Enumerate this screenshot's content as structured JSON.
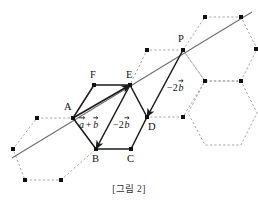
{
  "figure": {
    "caption": "[그림 2]",
    "type": "hexagonal-lattice-vector-diagram",
    "colors": {
      "solid_edge": "#1a1a1a",
      "dotted_edge": "#9a9a9a",
      "line": "#6e6e6e",
      "vertex": "#111111",
      "text": "#111111",
      "caption": "#303030",
      "background": "#ffffff"
    },
    "point_labels": [
      {
        "name": "A",
        "text": "A",
        "x": 73,
        "y": 118,
        "lx": 64,
        "ly": 110
      },
      {
        "name": "B",
        "text": "B",
        "x": 96,
        "y": 149,
        "lx": 92,
        "ly": 162
      },
      {
        "name": "C",
        "text": "C",
        "x": 131,
        "y": 149,
        "lx": 127,
        "ly": 162
      },
      {
        "name": "D",
        "text": "D",
        "x": 147,
        "y": 117,
        "lx": 148,
        "ly": 130
      },
      {
        "name": "E",
        "text": "E",
        "x": 130,
        "y": 85,
        "lx": 126,
        "ly": 78
      },
      {
        "name": "F",
        "text": "F",
        "x": 94,
        "y": 85,
        "lx": 90,
        "ly": 78
      },
      {
        "name": "P",
        "text": "P",
        "x": 183,
        "y": 50,
        "lx": 178,
        "ly": 42
      }
    ],
    "vectors": [
      {
        "name": "a-plus-b",
        "label": "a+b",
        "from": "A",
        "to": "E",
        "x1": 73,
        "y1": 118,
        "x2": 130,
        "y2": 85,
        "label_x": 79,
        "label_y": 128
      },
      {
        "name": "minus-2b-left",
        "label": "-2b",
        "from": "E",
        "to": "B",
        "x1": 130,
        "y1": 85,
        "x2": 96,
        "y2": 149,
        "label_x": 113,
        "label_y": 128
      },
      {
        "name": "minus-2b-right",
        "label": "-2b",
        "from": "P",
        "to": "D",
        "x1": 183,
        "y1": 50,
        "x2": 147,
        "y2": 117,
        "label_x": 167,
        "label_y": 91
      }
    ],
    "vector_label_parts": {
      "a": "a",
      "plus": "+",
      "b": "b",
      "minus_two": "−2"
    },
    "diagonal_line": {
      "name": "line-AP",
      "x1": 12,
      "y1": 158,
      "x2": 252,
      "y2": 12
    },
    "solid_hexagon": {
      "name": "hexagon-ABCDEF",
      "points": "73,118 94,85 130,85 147,117 131,149 96,149"
    },
    "dotted_hexagons": [
      {
        "name": "hex-lower-left",
        "points": "73,118 96,149 61,180 25,180 13,149 37,118"
      },
      {
        "name": "hex-upper-right",
        "points": "183,50 205,17 241,17 257,49 241,81 205,81"
      },
      {
        "name": "hex-left-of-P",
        "points": "183,50 147,50 130,85 147,117 183,117 205,81"
      },
      {
        "name": "hex-right-lower",
        "points": "205,81 241,81 257,113 241,145 205,145 188,113"
      }
    ],
    "lattice_dots": [
      {
        "x": 73,
        "y": 118
      },
      {
        "x": 94,
        "y": 85
      },
      {
        "x": 130,
        "y": 85
      },
      {
        "x": 147,
        "y": 117
      },
      {
        "x": 131,
        "y": 149
      },
      {
        "x": 96,
        "y": 149
      },
      {
        "x": 183,
        "y": 50
      },
      {
        "x": 147,
        "y": 50
      },
      {
        "x": 205,
        "y": 17
      },
      {
        "x": 241,
        "y": 17
      },
      {
        "x": 256,
        "y": 49
      },
      {
        "x": 205,
        "y": 81
      },
      {
        "x": 241,
        "y": 81
      },
      {
        "x": 183,
        "y": 117
      },
      {
        "x": 37,
        "y": 118
      },
      {
        "x": 13,
        "y": 149
      },
      {
        "x": 25,
        "y": 180
      },
      {
        "x": 61,
        "y": 180
      }
    ]
  }
}
